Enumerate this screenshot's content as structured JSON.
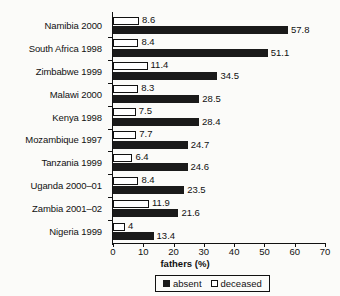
{
  "chart_data": {
    "type": "bar",
    "orientation": "horizontal",
    "title": "",
    "xlabel": "fathers (%)",
    "ylabel": "",
    "xlim": [
      0,
      70
    ],
    "xticks": [
      0,
      10,
      20,
      30,
      40,
      50,
      60,
      70
    ],
    "grid": false,
    "legend_position": "bottom",
    "categories": [
      "Namibia 2000",
      "South Africa 1998",
      "Zimbabwe 1999",
      "Malawi 2000",
      "Kenya 1998",
      "Mozambique 1997",
      "Tanzania 1999",
      "Uganda 2000–01",
      "Zambia 2001–02",
      "Nigeria 1999"
    ],
    "series": [
      {
        "name": "absent",
        "color": "#1a1a1a",
        "values": [
          57.8,
          51.1,
          34.5,
          28.5,
          28.4,
          24.7,
          24.6,
          23.5,
          21.6,
          13.4
        ],
        "labels": [
          "57.8",
          "51.1",
          "34.5",
          "28.5",
          "28.4",
          "24.7",
          "24.6",
          "23.5",
          "21.6",
          "13.4"
        ]
      },
      {
        "name": "deceased",
        "color": "#ffffff",
        "values": [
          8.6,
          8.4,
          11.4,
          8.3,
          7.5,
          7.7,
          6.4,
          8.4,
          11.9,
          4
        ],
        "labels": [
          "8.6",
          "8.4",
          "11.4",
          "8.3",
          "7.5",
          "7.7",
          "6.4",
          "8.4",
          "11.9",
          "4"
        ]
      }
    ],
    "legend": [
      {
        "label": "absent",
        "swatch": "filled-square"
      },
      {
        "label": "deceased",
        "swatch": "outlined-square"
      }
    ]
  }
}
